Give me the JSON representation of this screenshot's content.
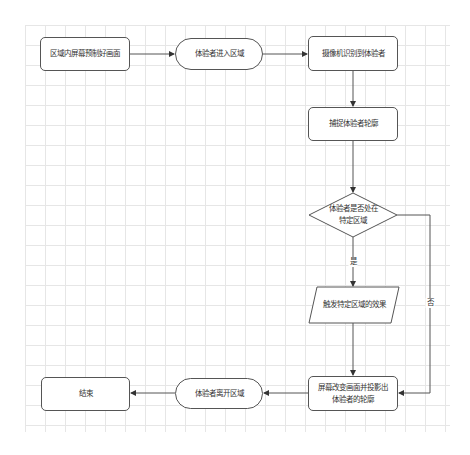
{
  "diagram": {
    "type": "flowchart",
    "colors": {
      "stroke": "#555555",
      "grid": "#e6e6e6",
      "text": "#333333",
      "fill": "#ffffff"
    },
    "nodes": {
      "start_box": {
        "label": "区域内屏幕预制好画面",
        "shape": "rounded-rect"
      },
      "enter_area": {
        "label": "体验者进入区域",
        "shape": "terminal"
      },
      "camera_detect": {
        "label": "摄像机识别到体验者",
        "shape": "rounded-rect"
      },
      "capture_outline": {
        "label": "捕捉体验者轮廓",
        "shape": "rounded-rect"
      },
      "decision": {
        "line1": "体验者是否处在",
        "line2": "特定区域",
        "shape": "diamond"
      },
      "trigger_effect": {
        "label": "触发特定区域的效果",
        "shape": "parallelogram"
      },
      "screen_change": {
        "line1": "屏幕改变画面并投影出",
        "line2": "体验者的轮廓",
        "shape": "rounded-rect"
      },
      "leave_area": {
        "label": "体验者离开区域",
        "shape": "terminal"
      },
      "end_box": {
        "label": "结束",
        "shape": "rounded-rect"
      }
    },
    "edge_labels": {
      "yes": "是",
      "no": "否"
    },
    "edges": [
      [
        "start_box",
        "enter_area"
      ],
      [
        "enter_area",
        "camera_detect"
      ],
      [
        "camera_detect",
        "capture_outline"
      ],
      [
        "capture_outline",
        "decision"
      ],
      [
        "decision",
        "trigger_effect",
        "是"
      ],
      [
        "trigger_effect",
        "screen_change"
      ],
      [
        "decision",
        "screen_change",
        "否"
      ],
      [
        "screen_change",
        "leave_area"
      ],
      [
        "leave_area",
        "end_box"
      ]
    ]
  }
}
